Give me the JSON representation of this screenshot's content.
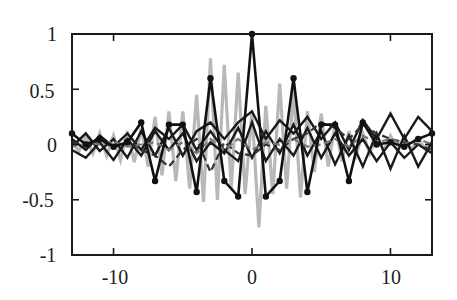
{
  "chart_data": {
    "type": "line",
    "title": "",
    "xlabel": "",
    "ylabel": "",
    "xlim": [
      -13,
      13
    ],
    "ylim": [
      -1,
      1
    ],
    "grid": false,
    "legend": null,
    "xticks": [
      -10,
      0,
      10
    ],
    "xtick_labels": [
      "-10",
      "0",
      "10"
    ],
    "yticks": [
      1,
      0.5,
      0,
      -0.5,
      -1
    ],
    "ytick_labels": [
      "1",
      "0.5",
      "0",
      "-0.5",
      "-1"
    ],
    "series": [
      {
        "name": "gray-dense",
        "color": "#b8b8b8",
        "style": "solid",
        "width": 3.2,
        "markers": false,
        "x": [
          -13,
          -12.5,
          -12,
          -11.5,
          -11,
          -10.5,
          -10,
          -9.5,
          -9,
          -8.5,
          -8,
          -7.5,
          -7,
          -6.5,
          -6,
          -5.5,
          -5,
          -4.5,
          -4,
          -3.5,
          -3,
          -2.5,
          -2,
          -1.5,
          -1,
          -0.5,
          0,
          0.5,
          1,
          1.5,
          2,
          2.5,
          3,
          3.5,
          4,
          4.5,
          5,
          5.5,
          6,
          6.5,
          7,
          7.5,
          8,
          8.5,
          9,
          9.5,
          10,
          10.5,
          11,
          11.5,
          12,
          12.5,
          13
        ],
        "values": [
          0.02,
          -0.06,
          0.08,
          -0.08,
          0.1,
          -0.1,
          0.08,
          -0.14,
          0.12,
          -0.16,
          0.15,
          -0.2,
          0.25,
          -0.28,
          0.3,
          -0.33,
          0.3,
          -0.4,
          0.45,
          -0.52,
          0.78,
          -0.5,
          0.72,
          -0.4,
          0.65,
          -0.45,
          0.3,
          -0.75,
          0.35,
          -0.45,
          0.55,
          -0.4,
          0.5,
          -0.48,
          0.3,
          -0.25,
          0.28,
          -0.2,
          0.18,
          -0.15,
          0.12,
          -0.1,
          0.1,
          -0.08,
          0.08,
          -0.06,
          0.08,
          -0.05,
          0.06,
          -0.05,
          0.05,
          -0.04,
          0.03
        ]
      },
      {
        "name": "zigzag-a",
        "color": "#1a1a1a",
        "style": "solid",
        "width": 2.4,
        "markers": false,
        "x": [
          -13,
          -12,
          -11,
          -10,
          -9,
          -8,
          -7,
          -6,
          -5,
          -4,
          -3,
          -2,
          -1,
          0,
          1,
          2,
          3,
          4,
          5,
          6,
          7,
          8,
          9,
          10,
          11,
          12,
          13
        ],
        "values": [
          -0.02,
          0.1,
          -0.06,
          0.05,
          -0.12,
          0.12,
          -0.1,
          0.15,
          -0.1,
          0.12,
          0.2,
          0.05,
          0.2,
          0.3,
          0.05,
          0.22,
          0.1,
          0.25,
          0.05,
          0.2,
          -0.05,
          0.22,
          0.05,
          0.28,
          0.05,
          0.25,
          0.12
        ]
      },
      {
        "name": "zigzag-b",
        "color": "#1a1a1a",
        "style": "solid",
        "width": 2.4,
        "markers": false,
        "x": [
          -13,
          -12,
          -11,
          -10,
          -9,
          -8,
          -7,
          -6,
          -5,
          -4,
          -3,
          -2,
          -1,
          0,
          1,
          2,
          3,
          4,
          5,
          6,
          7,
          8,
          9,
          10,
          11,
          12,
          13
        ],
        "values": [
          -0.05,
          -0.12,
          0.02,
          -0.14,
          0.05,
          -0.1,
          0.12,
          -0.05,
          0.1,
          -0.15,
          0.02,
          -0.08,
          0.15,
          -0.12,
          0.12,
          -0.08,
          0.18,
          -0.1,
          0.12,
          -0.18,
          0.08,
          -0.2,
          0.1,
          -0.22,
          0.08,
          -0.2,
          0.02
        ]
      },
      {
        "name": "zigzag-c",
        "color": "#1a1a1a",
        "style": "solid",
        "width": 2.4,
        "markers": false,
        "x": [
          -13,
          -12,
          -11,
          -10,
          -9,
          -8,
          -7,
          -6,
          -5,
          -4,
          -3,
          -2,
          -1,
          0,
          1,
          2,
          3,
          4,
          5,
          6,
          7,
          8,
          9,
          10,
          11,
          12,
          13
        ],
        "values": [
          0.05,
          -0.05,
          0.08,
          -0.02,
          0.1,
          -0.05,
          0.15,
          0.05,
          0.18,
          -0.05,
          0.12,
          -0.05,
          -0.15,
          0.2,
          -0.15,
          0.05,
          -0.1,
          0.15,
          -0.12,
          0.1,
          -0.1,
          0.05,
          -0.15,
          0.02,
          -0.12,
          0.0,
          -0.08
        ]
      },
      {
        "name": "dashed-a",
        "color": "#333333",
        "style": "dashed",
        "width": 2.2,
        "markers": false,
        "x": [
          -13,
          -12,
          -11,
          -10,
          -9,
          -8,
          -7,
          -6,
          -5,
          -4,
          -3,
          -2,
          -1,
          0,
          1,
          2,
          3,
          4,
          5,
          6,
          7,
          8,
          9,
          10,
          11,
          12,
          13
        ],
        "values": [
          0.02,
          0.0,
          0.03,
          -0.02,
          0.05,
          -0.05,
          -0.1,
          -0.2,
          -0.05,
          0.05,
          -0.25,
          0.02,
          -0.08,
          -0.1,
          0.0,
          -0.05,
          0.05,
          0.1,
          0.2,
          0.15,
          0.05,
          0.18,
          0.1,
          0.05,
          0.02,
          0.0,
          -0.05
        ]
      },
      {
        "name": "dashed-gray",
        "color": "#777777",
        "style": "dashed",
        "width": 2.2,
        "markers": false,
        "x": [
          -13,
          -12,
          -11,
          -10,
          -9,
          -8,
          -7,
          -6,
          -5,
          -4,
          -3,
          -2,
          -1,
          0,
          1,
          2,
          3,
          4,
          5,
          6,
          7,
          8,
          9,
          10,
          11,
          12,
          13
        ],
        "values": [
          -0.02,
          0.02,
          0.0,
          0.03,
          -0.02,
          0.0,
          0.02,
          -0.05,
          0.02,
          -0.08,
          0.05,
          -0.05,
          0.05,
          -0.05,
          0.02,
          0.0,
          0.05,
          -0.02,
          0.0,
          0.05,
          -0.02,
          0.08,
          0.02,
          0.05,
          0.0,
          0.05,
          0.0
        ]
      },
      {
        "name": "main-with-markers",
        "color": "#111111",
        "style": "solid",
        "width": 2.6,
        "markers": true,
        "x": [
          -13,
          -12,
          -11,
          -10,
          -9,
          -8,
          -7,
          -6,
          -5,
          -4,
          -3,
          -2,
          -1,
          0,
          1,
          2,
          3,
          4,
          5,
          6,
          7,
          8,
          9,
          10,
          11,
          12,
          13
        ],
        "values": [
          0.1,
          0.0,
          0.05,
          -0.02,
          0.02,
          0.2,
          -0.33,
          0.18,
          0.18,
          -0.43,
          0.6,
          -0.33,
          -0.47,
          1.0,
          -0.47,
          -0.33,
          0.6,
          -0.43,
          0.18,
          0.18,
          -0.33,
          0.2,
          0.0,
          0.02,
          -0.02,
          0.05,
          0.1
        ]
      }
    ]
  }
}
